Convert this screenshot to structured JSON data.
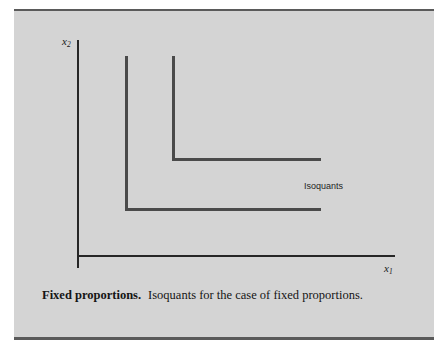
{
  "figure": {
    "panel_color": "#d4d4d4",
    "rule_color": "#5a5a5a",
    "axis_color": "#262626",
    "curve_color": "#4a4a4a"
  },
  "axes": {
    "y_label_base": "x",
    "y_label_sub": "2",
    "x_label_base": "x",
    "x_label_sub": "1"
  },
  "annotation": {
    "isoquants": "Isoquants"
  },
  "caption": {
    "title": "Fixed proportions.",
    "body": "Isoquants for the case of fixed proportions."
  },
  "chart_data": {
    "type": "line",
    "title": "Fixed proportions",
    "subtitle": "Isoquants for the case of fixed proportions.",
    "xlabel": "x1",
    "ylabel": "x2",
    "grid": false,
    "legend": "none",
    "annotations": [
      "Isoquants"
    ],
    "series": [
      {
        "name": "Isoquant 1 (lower)",
        "kink": {
          "x": 1.0,
          "y": 1.0
        },
        "points": [
          {
            "x": 1.0,
            "y": 3.9
          },
          {
            "x": 1.0,
            "y": 1.0
          },
          {
            "x": 4.2,
            "y": 1.0
          }
        ]
      },
      {
        "name": "Isoquant 2 (upper)",
        "kink": {
          "x": 1.5,
          "y": 1.6
        },
        "points": [
          {
            "x": 1.5,
            "y": 3.9
          },
          {
            "x": 1.5,
            "y": 1.6
          },
          {
            "x": 4.2,
            "y": 1.6
          }
        ]
      }
    ],
    "xlim": [
      0,
      5
    ],
    "ylim": [
      0,
      4.3
    ]
  }
}
